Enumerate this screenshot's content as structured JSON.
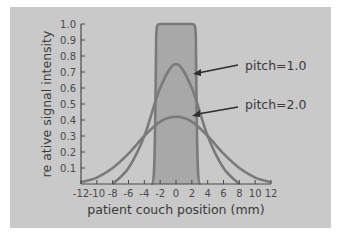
{
  "chart_data": {
    "type": "line",
    "title": "",
    "xlabel": "patient couch position (mm)",
    "ylabel": "re ative signal intensity",
    "xlim": [
      -12,
      12
    ],
    "ylim": [
      0,
      1.0
    ],
    "x_ticks": [
      "-12",
      "-10",
      "-8",
      "-6",
      "-4",
      "-2",
      "0",
      "2",
      "4",
      "6",
      "8",
      "10",
      "12"
    ],
    "y_ticks": [
      "0.1",
      "0.2",
      "0.3",
      "0.4",
      "0.5",
      "0.6",
      "0.7",
      "0.8",
      "0.9",
      "1.0"
    ],
    "grid": false,
    "legend": "inline annotations with arrows",
    "series": [
      {
        "name": "slice profile (rect)",
        "x": [
          -3.0,
          -2.8,
          -2.5,
          -2.0,
          0,
          2.0,
          2.5,
          2.8,
          3.0
        ],
        "values": [
          0.0,
          0.1,
          0.9,
          1.0,
          1.0,
          1.0,
          0.9,
          0.1,
          0.0
        ],
        "filled": true
      },
      {
        "name": "pitch=1.0",
        "x": [
          -8,
          -6,
          -4,
          -2,
          0,
          2,
          4,
          6,
          8
        ],
        "values": [
          0.0,
          0.1,
          0.3,
          0.6,
          0.75,
          0.6,
          0.3,
          0.1,
          0.0
        ]
      },
      {
        "name": "pitch=2.0",
        "x": [
          -12,
          -10,
          -8,
          -6,
          -4,
          -2,
          0,
          2,
          4,
          6,
          8,
          10,
          12
        ],
        "values": [
          0.01,
          0.04,
          0.1,
          0.19,
          0.3,
          0.39,
          0.42,
          0.39,
          0.3,
          0.19,
          0.1,
          0.04,
          0.01
        ]
      }
    ],
    "annotations": [
      {
        "text": "pitch=1.0",
        "points_to": "pitch=1.0"
      },
      {
        "text": "pitch=2.0",
        "points_to": "pitch=2.0"
      }
    ]
  },
  "colors": {
    "background": "#c9c9c9",
    "curve": "#7a7a7a",
    "fill": "#a8a8a8",
    "axis": "#4a4a4a",
    "text": "#3a3a3a"
  }
}
